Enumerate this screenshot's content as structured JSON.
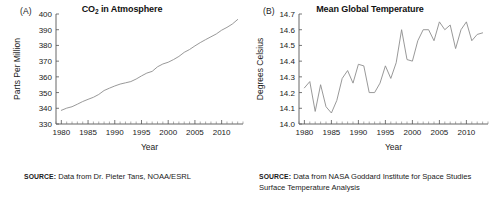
{
  "figure": {
    "panels": [
      {
        "label": "(A)",
        "title_main": "CO",
        "title_sub": "2",
        "title_rest": " in Atmosphere",
        "title_full": "CO2 in Atmosphere",
        "xlabel": "Year",
        "ylabel": "Parts Per Million",
        "source_prefix": "SOURCE:",
        "source_text": " Data from Dr. Pieter Tans, NOAA/ESRL"
      },
      {
        "label": "(B)",
        "title_main": "Mean Global Temperature",
        "title_sub": "",
        "title_rest": "",
        "title_full": "Mean Global Temperature",
        "xlabel": "Year",
        "ylabel": "Degrees Celsius",
        "source_prefix": "SOURCE:",
        "source_text": " Data from NASA Goddard Institute for Space Studies Surface Temperature Analysis"
      }
    ],
    "colors": {
      "line": "#8d8d8d",
      "axis": "#555555",
      "text": "#1a1a1a",
      "background": "#ffffff"
    }
  },
  "chart_data": [
    {
      "type": "line",
      "title": "CO2 in Atmosphere",
      "xlabel": "Year",
      "ylabel": "Parts Per Million",
      "xlim": [
        1979,
        2014
      ],
      "ylim": [
        330,
        400
      ],
      "yticks": [
        330,
        340,
        350,
        360,
        370,
        380,
        390,
        400
      ],
      "xticks": [
        1980,
        1985,
        1990,
        1995,
        2000,
        2005,
        2010
      ],
      "grid": false,
      "legend": "none",
      "x": [
        1980,
        1981,
        1982,
        1983,
        1984,
        1985,
        1986,
        1987,
        1988,
        1989,
        1990,
        1991,
        1992,
        1993,
        1994,
        1995,
        1996,
        1997,
        1998,
        1999,
        2000,
        2001,
        2002,
        2003,
        2004,
        2005,
        2006,
        2007,
        2008,
        2009,
        2010,
        2011,
        2012,
        2013
      ],
      "values": [
        338.7,
        340.1,
        341.0,
        342.6,
        344.3,
        345.7,
        347.0,
        348.8,
        351.3,
        352.8,
        354.2,
        355.4,
        356.2,
        357.0,
        358.6,
        360.6,
        362.4,
        363.5,
        366.4,
        368.2,
        369.3,
        371.0,
        373.0,
        375.6,
        377.4,
        379.7,
        381.8,
        383.7,
        385.5,
        387.3,
        389.7,
        391.5,
        393.6,
        396.5
      ]
    },
    {
      "type": "line",
      "title": "Mean Global Temperature",
      "xlabel": "Year",
      "ylabel": "Degrees Celsius",
      "xlim": [
        1979,
        2014
      ],
      "ylim": [
        14.0,
        14.7
      ],
      "yticks": [
        14.0,
        14.1,
        14.2,
        14.3,
        14.4,
        14.5,
        14.6,
        14.7
      ],
      "xticks": [
        1980,
        1985,
        1990,
        1995,
        2000,
        2005,
        2010
      ],
      "grid": false,
      "legend": "none",
      "x": [
        1980,
        1981,
        1982,
        1983,
        1984,
        1985,
        1986,
        1987,
        1988,
        1989,
        1990,
        1991,
        1992,
        1993,
        1994,
        1995,
        1996,
        1997,
        1998,
        1999,
        2000,
        2001,
        2002,
        2003,
        2004,
        2005,
        2006,
        2007,
        2008,
        2009,
        2010,
        2011,
        2012,
        2013
      ],
      "values": [
        14.23,
        14.27,
        14.08,
        14.25,
        14.11,
        14.07,
        14.15,
        14.29,
        14.34,
        14.26,
        14.38,
        14.37,
        14.2,
        14.2,
        14.26,
        14.37,
        14.29,
        14.39,
        14.6,
        14.41,
        14.4,
        14.53,
        14.6,
        14.6,
        14.53,
        14.65,
        14.6,
        14.63,
        14.48,
        14.6,
        14.65,
        14.53,
        14.57,
        14.58
      ]
    }
  ]
}
